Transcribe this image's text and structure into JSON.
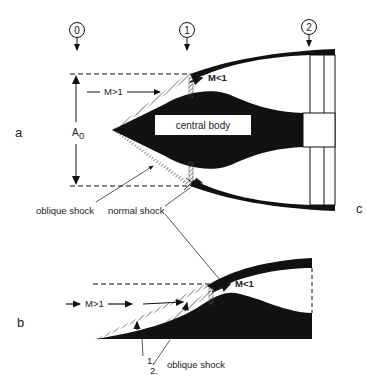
{
  "figure": {
    "panels": {
      "a": "a",
      "b": "b",
      "c": "c"
    },
    "stations": [
      "0",
      "1",
      "2"
    ],
    "labels": {
      "mach_supersonic": "M>1",
      "mach_subsonic": "M<1",
      "capture_area": "A",
      "capture_area_sub": "0",
      "central_body": "central body",
      "oblique_shock": "oblique shock",
      "normal_shock": "normal shock",
      "shock_1": "1.",
      "shock_2": "2."
    },
    "colors": {
      "ink": "#111111",
      "background": "#ffffff",
      "shock_hatch": "#555555"
    }
  }
}
